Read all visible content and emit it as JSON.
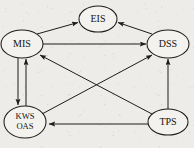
{
  "figure": {
    "type": "directed-graph",
    "background_color": "#edece8",
    "ink_color": "#1d1c1a",
    "node_fill": "#f3f2ee",
    "width": 194,
    "height": 148
  },
  "nodes": [
    {
      "id": "MIS",
      "label": "MIS",
      "lines": [
        "MIS"
      ],
      "cx": 22,
      "cy": 44,
      "rx": 21,
      "ry": 14
    },
    {
      "id": "EIS",
      "label": "EIS",
      "lines": [
        "EIS"
      ],
      "cx": 98,
      "cy": 19,
      "rx": 19,
      "ry": 13
    },
    {
      "id": "DSS",
      "label": "DSS",
      "lines": [
        "DSS"
      ],
      "cx": 168,
      "cy": 44,
      "rx": 21,
      "ry": 14
    },
    {
      "id": "KWS_OAS",
      "label": "KWS OAS",
      "lines": [
        "KWS",
        "OAS"
      ],
      "cx": 25,
      "cy": 122,
      "rx": 21,
      "ry": 16
    },
    {
      "id": "TPS",
      "label": "TPS",
      "lines": [
        "TPS"
      ],
      "cx": 168,
      "cy": 122,
      "rx": 20,
      "ry": 13
    }
  ],
  "edges": [
    {
      "from": "MIS",
      "to": "EIS",
      "arrow": "end",
      "style": "straight"
    },
    {
      "from": "DSS",
      "to": "EIS",
      "arrow": "end",
      "style": "straight"
    },
    {
      "from": "MIS",
      "to": "DSS",
      "arrow": "end",
      "style": "straight"
    },
    {
      "from": "MIS",
      "to": "KWS_OAS",
      "arrow": "end",
      "style": "parallel-down"
    },
    {
      "from": "KWS_OAS",
      "to": "MIS",
      "arrow": "end",
      "style": "parallel-up"
    },
    {
      "from": "KWS_OAS",
      "to": "DSS",
      "arrow": "end",
      "style": "diagonal"
    },
    {
      "from": "TPS",
      "to": "MIS",
      "arrow": "end",
      "style": "diagonal"
    },
    {
      "from": "TPS",
      "to": "DSS",
      "arrow": "end",
      "style": "straight"
    },
    {
      "from": "TPS",
      "to": "KWS_OAS",
      "arrow": "end",
      "style": "straight"
    }
  ]
}
